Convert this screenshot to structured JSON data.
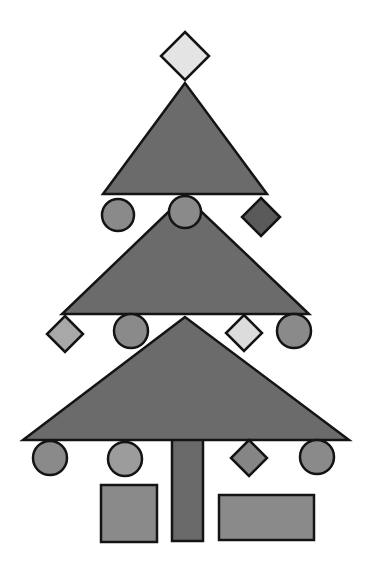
{
  "scene": {
    "title": "Christmas tree made of geometric shapes",
    "width": 369,
    "height": 577,
    "background": "#ffffff",
    "stroke_color": "#141414",
    "stroke_width": 2.5
  },
  "colors": {
    "foliage": "#6b6b6b",
    "trunk": "#696969",
    "circle_dark": "#8a8a8a",
    "circle_light": "#9c9c9c",
    "diamond_light": "#dcdcdc",
    "diamond_top": "#e4e4e4",
    "diamond_mid": "#a8a8a8",
    "diamond_dark": "#5a5a5a",
    "diamond_gray": "#858585",
    "gift": "#8a8a8a"
  },
  "tree": {
    "tiers": [
      {
        "name": "tier-3-bottom",
        "points": [
          [
            185,
            317
          ],
          [
            23,
            440
          ],
          [
            349,
            440
          ]
        ]
      },
      {
        "name": "tier-2-middle",
        "points": [
          [
            185,
            196
          ],
          [
            62,
            314
          ],
          [
            309,
            314
          ]
        ]
      },
      {
        "name": "tier-1-top",
        "points": [
          [
            185,
            83
          ],
          [
            103,
            194
          ],
          [
            267,
            194
          ]
        ]
      }
    ],
    "trunk": {
      "x": 172,
      "y": 439,
      "width": 31,
      "height": 102
    }
  },
  "topper": {
    "cx": 185,
    "cy": 56,
    "r": 24,
    "fill_key": "diamond_top"
  },
  "ornaments": [
    {
      "type": "circle",
      "cx": 118,
      "cy": 215,
      "r": 16,
      "fill_key": "circle_dark"
    },
    {
      "type": "circle",
      "cx": 185,
      "cy": 212,
      "r": 16,
      "fill_key": "circle_dark"
    },
    {
      "type": "diamond",
      "cx": 261,
      "cy": 217,
      "r": 19,
      "fill_key": "diamond_dark"
    },
    {
      "type": "diamond",
      "cx": 65,
      "cy": 334,
      "r": 18,
      "fill_key": "diamond_mid"
    },
    {
      "type": "circle",
      "cx": 131,
      "cy": 331,
      "r": 17,
      "fill_key": "circle_dark"
    },
    {
      "type": "diamond",
      "cx": 244,
      "cy": 333,
      "r": 18,
      "fill_key": "diamond_light"
    },
    {
      "type": "circle",
      "cx": 294,
      "cy": 331,
      "r": 17,
      "fill_key": "circle_dark"
    },
    {
      "type": "circle",
      "cx": 50,
      "cy": 458,
      "r": 17,
      "fill_key": "circle_dark"
    },
    {
      "type": "circle",
      "cx": 125,
      "cy": 459,
      "r": 17,
      "fill_key": "circle_light"
    },
    {
      "type": "diamond",
      "cx": 249,
      "cy": 458,
      "r": 18,
      "fill_key": "diamond_gray"
    },
    {
      "type": "circle",
      "cx": 317,
      "cy": 457,
      "r": 17,
      "fill_key": "circle_dark"
    }
  ],
  "gifts": [
    {
      "name": "gift-square",
      "x": 101,
      "y": 485,
      "width": 56,
      "height": 57,
      "fill_key": "gift"
    },
    {
      "name": "gift-wide",
      "x": 219,
      "y": 495,
      "width": 95,
      "height": 45,
      "fill_key": "gift"
    }
  ]
}
